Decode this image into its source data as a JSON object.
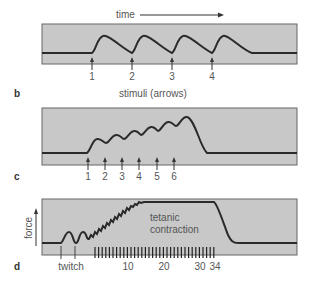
{
  "header": {
    "time_label": "time"
  },
  "panels": {
    "b": {
      "letter": "b",
      "caption": "stimuli (arrows)",
      "stimuli": [
        "1",
        "2",
        "3",
        "4"
      ]
    },
    "c": {
      "letter": "c",
      "stimuli": [
        "1",
        "2",
        "3",
        "4",
        "5",
        "6"
      ]
    },
    "d": {
      "letter": "d",
      "y_axis_label": "force",
      "twitch_label": "twitch",
      "tetanic_label_line1": "tetanic",
      "tetanic_label_line2": "contraction",
      "stimulus_ticks": [
        "10",
        "20",
        "30",
        "34"
      ],
      "stimulus_count": 34
    }
  },
  "colors": {
    "panel_fill": "#c8c8c8",
    "panel_border": "#555555",
    "trace": "#2a2a2a",
    "text": "#555555"
  }
}
